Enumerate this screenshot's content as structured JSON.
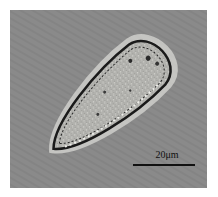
{
  "image": {
    "subject": "teardrop-shaped ciliate cell",
    "background_color": "#8a8a8a",
    "cell_fill_color": "#b4b4b0",
    "cell_outline_color": "#1a1a1a",
    "halo_color": "#d8d8d4"
  },
  "scale_bar": {
    "label": "20μm",
    "color": "#111111"
  }
}
